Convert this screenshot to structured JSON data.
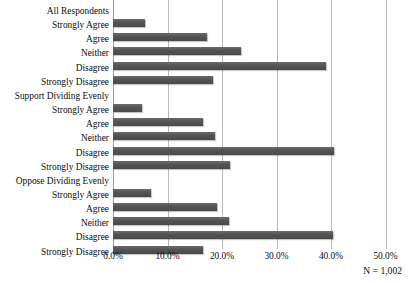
{
  "chart_data": {
    "type": "bar",
    "orientation": "horizontal",
    "title": "",
    "subtitle": "",
    "xlabel": "",
    "ylabel": "",
    "xlim": [
      0,
      50
    ],
    "xticks": [
      "0.0%",
      "10.0%",
      "20.0%",
      "30.0%",
      "40.0%",
      "50.0%"
    ],
    "xtick_values": [
      0,
      10,
      20,
      30,
      40,
      50
    ],
    "grid": true,
    "legend": false,
    "legend_position": "none",
    "bar_color": "#545454",
    "gridline_color": "#b9b9b9",
    "groups": [
      {
        "name": "All Respondents",
        "categories": [
          "Strongly Agree",
          "Agree",
          "Neither",
          "Disagree",
          "Strongly Disagree"
        ],
        "values": [
          5.9,
          17.3,
          23.5,
          39.0,
          18.4
        ]
      },
      {
        "name": "Support Dividing Evenly",
        "categories": [
          "Strongly Agree",
          "Agree",
          "Neither",
          "Disagree",
          "Strongly Disagree"
        ],
        "values": [
          5.4,
          16.6,
          18.8,
          40.6,
          21.5
        ]
      },
      {
        "name": "Oppose Dividing Evenly",
        "categories": [
          "Strongly Agree",
          "Agree",
          "Neither",
          "Disagree",
          "Strongly Disagree"
        ],
        "values": [
          7.0,
          19.0,
          21.2,
          40.3,
          16.6
        ]
      }
    ],
    "annotations": [
      "N = 1,002"
    ]
  },
  "footnote": "N = 1,002"
}
